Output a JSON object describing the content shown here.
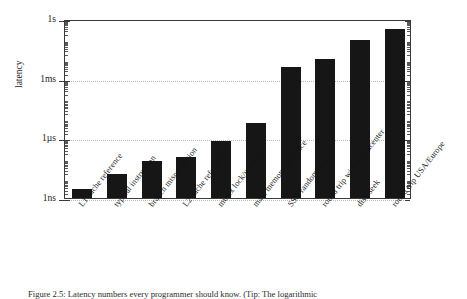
{
  "figure": {
    "caption": "Figure 2.5: Latency numbers every programmer should know. (Tip: The logarithmic"
  },
  "chart_data": {
    "type": "bar",
    "title": "",
    "xlabel": "",
    "ylabel": "latency",
    "scale": "log",
    "grid": true,
    "legend": "none",
    "ylim": [
      "1ns",
      "1s"
    ],
    "ytick_labels": [
      "1ns",
      "1µs",
      "1ms",
      "1s"
    ],
    "ytick_values_seconds": [
      1e-09,
      1e-06,
      0.001,
      1
    ],
    "categories": [
      "L1 cache reference",
      "typical instruction",
      "branch misprediction",
      "L2 cache reference",
      "mutex lock/unlock",
      "main memory reference",
      "SSD random read",
      "round trip within datacenter",
      "disk seek",
      "round trip USA/Europe"
    ],
    "values_seconds": [
      5e-10,
      1e-09,
      3e-09,
      4e-09,
      1.7e-08,
      1e-07,
      0.00015,
      0.0005,
      0.01,
      0.15
    ],
    "value_labels": [
      "0.5 ns",
      "1 ns",
      "3 ns",
      "4 ns",
      "17 ns",
      "100 ns",
      "150 µs",
      "500 µs",
      "10 ms",
      "150 ms"
    ],
    "bar_pixel_heights": [
      9,
      24,
      37,
      41,
      57,
      75,
      131,
      139,
      158,
      169
    ],
    "bar_color": "#161616"
  }
}
